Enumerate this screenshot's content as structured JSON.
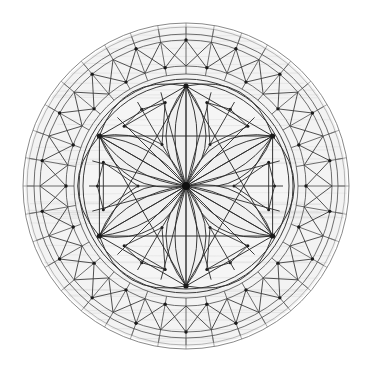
{
  "figure": {
    "kind": "radial-symmetry-line-drawing",
    "canvas": {
      "width": 372,
      "height": 369,
      "background": "#ffffff"
    },
    "center": {
      "x": 186,
      "y": 186
    }
  },
  "palette": {
    "background": "#ffffff",
    "line_dark": "#2b2b2b",
    "line_mid": "#4a4a4a",
    "line_light": "#8a8a8a",
    "fill_ring": "#f3f3f3",
    "fill_core": "#f5f5f5",
    "fill_petal": "#f0f0f0",
    "texture": "#d8d8d8",
    "node": "#1a1a1a"
  },
  "geometry": {
    "rings": [
      {
        "name": "outer-rim-1",
        "radius": 163,
        "style": "circ-outer"
      },
      {
        "name": "outer-rim-2",
        "radius": 159,
        "style": "circ-thin"
      },
      {
        "name": "outer-band-out",
        "radius": 152,
        "style": "circ-mid"
      },
      {
        "name": "zigzag-outer",
        "radius": 146,
        "style": "circ-mid"
      },
      {
        "name": "zigzag-inner",
        "radius": 120,
        "style": "circ-mid"
      },
      {
        "name": "inner-band-in",
        "radius": 112,
        "style": "circ-mid"
      },
      {
        "name": "core-rim-1",
        "radius": 107,
        "style": "circ-inner"
      },
      {
        "name": "core-rim-2",
        "radius": 103,
        "style": "circ-inner"
      }
    ],
    "spoke_count": 36,
    "spoke_inner_radius": 112,
    "spoke_outer_radius": 159,
    "zigzag_count": 36,
    "zigzag_outer_radius": 146,
    "zigzag_inner_radius": 120,
    "hex_vertex_radius": 100,
    "hex_vertex_count": 6,
    "hex_vertex_angles_deg": [
      -90,
      -30,
      30,
      90,
      150,
      210
    ],
    "petal_count": 6,
    "petal_bulge": 40,
    "hub_ray_count": 24,
    "hub_radius": 4,
    "motif_triangle_count": 6,
    "motif_inner_radius": 48,
    "motif_outer_radius": 86
  },
  "labels": {
    "figure_caption": "",
    "center_node": "hub",
    "outer_ring": "tracery band",
    "inner_core": "rosette core"
  }
}
